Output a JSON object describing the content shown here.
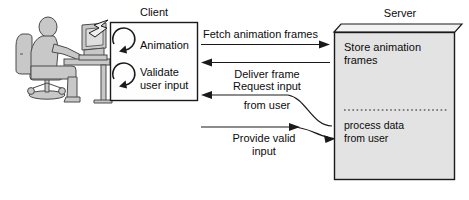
{
  "diagram": {
    "type": "client-server-sequence",
    "title_client": "Client",
    "title_server": "Server",
    "colors": {
      "stroke": "#1a1a1a",
      "text": "#0c0c0c",
      "silhouette_fill": "#c8c8c8",
      "silhouette_stroke": "#4a4a4a",
      "client_fill": "#fefefe",
      "server_fill": "#e3e3e3",
      "server_top_fill": "#f2f2f2",
      "background": "#ffffff"
    }
  },
  "actor": {
    "name": "user-at-computer",
    "description": "person seated at desk using a computer"
  },
  "callout": {
    "name": "zigzag-callout-connector"
  },
  "client": {
    "label": "Client",
    "tasks": [
      {
        "icon": "circular-arrow-icon",
        "label": "Animation"
      },
      {
        "icon": "circular-arrow-icon",
        "label_line1": "Validate",
        "label_line2": "user input"
      }
    ]
  },
  "server": {
    "label": "Server",
    "blocks": [
      {
        "line1": "Store animation",
        "line2": "frames"
      },
      {
        "line1": "process data",
        "line2": "from user"
      }
    ],
    "divider": "dotted-divider"
  },
  "messages": [
    {
      "id": "fetch-animation-frames",
      "label": "Fetch animation frames",
      "direction": "client-to-server"
    },
    {
      "id": "deliver-frame",
      "label": "Deliver frame",
      "direction": "server-to-client"
    },
    {
      "id": "request-input-from-user",
      "label_line1": "Request input",
      "label_line2": "from user",
      "direction": "server-to-client"
    },
    {
      "id": "provide-valid-input",
      "label_line1": "Provide valid",
      "label_line2": "input",
      "direction": "client-to-server"
    }
  ]
}
